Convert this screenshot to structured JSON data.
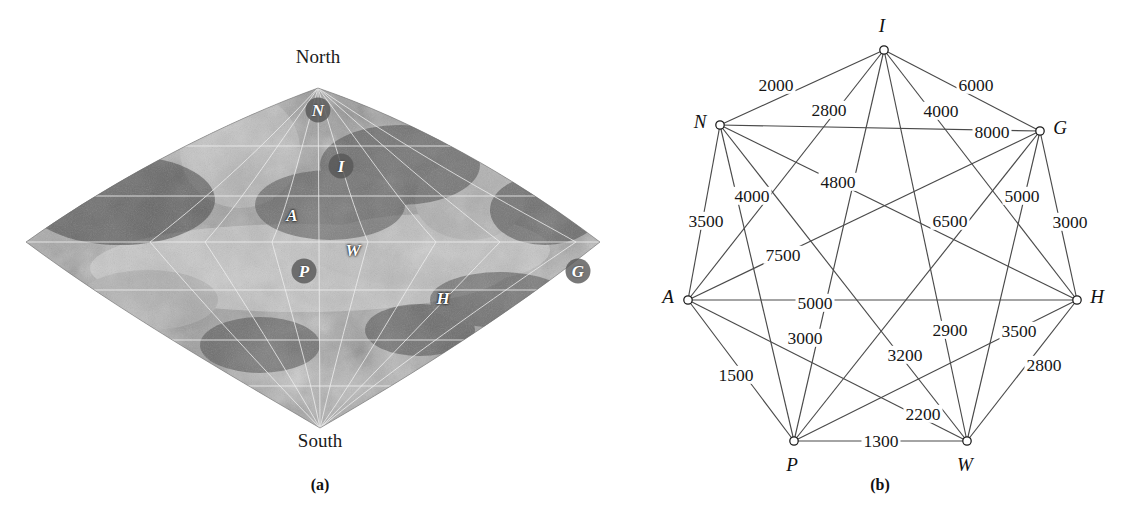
{
  "figure": {
    "panels": [
      {
        "caption": "(a)",
        "caption_x": 320,
        "caption_y": 476
      },
      {
        "caption": "(b)",
        "caption_x": 880,
        "caption_y": 476
      }
    ]
  },
  "map": {
    "north_label": "North",
    "south_label": "South",
    "north_x": 318,
    "north_y": 56,
    "south_x": 320,
    "south_y": 430,
    "sites": [
      {
        "id": "N",
        "label": "N",
        "x": 318,
        "y": 110,
        "badge": true
      },
      {
        "id": "I",
        "label": "I",
        "x": 341,
        "y": 166,
        "badge": true
      },
      {
        "id": "A",
        "label": "A",
        "x": 292,
        "y": 215,
        "badge": false
      },
      {
        "id": "W",
        "label": "W",
        "x": 353,
        "y": 250,
        "badge": false
      },
      {
        "id": "P",
        "label": "P",
        "x": 304,
        "y": 271,
        "badge": true
      },
      {
        "id": "H",
        "label": "H",
        "x": 443,
        "y": 298,
        "badge": false
      },
      {
        "id": "G",
        "label": "G",
        "x": 578,
        "y": 271,
        "badge": true
      }
    ]
  },
  "graph": {
    "type": "weighted-complete-graph",
    "node_count": 7,
    "edge_count": 21,
    "nodes": [
      {
        "id": "I",
        "label": "I",
        "x": 284,
        "y": 50,
        "label_dx": -2,
        "label_dy": -24
      },
      {
        "id": "N",
        "label": "N",
        "x": 120,
        "y": 125,
        "label_dx": -20,
        "label_dy": -3
      },
      {
        "id": "G",
        "label": "G",
        "x": 440,
        "y": 131,
        "label_dx": 20,
        "label_dy": -3
      },
      {
        "id": "A",
        "label": "A",
        "x": 88,
        "y": 300,
        "label_dx": -20,
        "label_dy": -3
      },
      {
        "id": "H",
        "label": "H",
        "x": 477,
        "y": 300,
        "label_dx": 20,
        "label_dy": -3
      },
      {
        "id": "P",
        "label": "P",
        "x": 194,
        "y": 441,
        "label_dx": -2,
        "label_dy": 24
      },
      {
        "id": "W",
        "label": "W",
        "x": 367,
        "y": 441,
        "label_dx": -2,
        "label_dy": 24
      }
    ],
    "edges": [
      {
        "from": "N",
        "to": "I",
        "weight": "2000",
        "lx": 176,
        "ly": 85
      },
      {
        "from": "I",
        "to": "P",
        "weight": "2800",
        "lx": 229,
        "ly": 110
      },
      {
        "from": "I",
        "to": "G",
        "weight": "6000",
        "lx": 376,
        "ly": 85
      },
      {
        "from": "I",
        "to": "W",
        "weight": "4000",
        "lx": 341,
        "ly": 111
      },
      {
        "from": "N",
        "to": "G",
        "weight": "8000",
        "lx": 392,
        "ly": 132
      },
      {
        "from": "N",
        "to": "A",
        "weight": "3500",
        "lx": 106,
        "ly": 221
      },
      {
        "from": "N",
        "to": "P",
        "weight": "4000",
        "lx": 152,
        "ly": 196
      },
      {
        "from": "N",
        "to": "H",
        "weight": "4800",
        "lx": 238,
        "ly": 182
      },
      {
        "from": "N",
        "to": "W",
        "weight": "7500",
        "lx": 183,
        "ly": 255
      },
      {
        "from": "A",
        "to": "I",
        "weight": "6500",
        "lx": 350,
        "ly": 221
      },
      {
        "from": "G",
        "to": "W",
        "weight": "5000",
        "lx": 422,
        "ly": 196
      },
      {
        "from": "G",
        "to": "H",
        "weight": "3000",
        "lx": 470,
        "ly": 222
      },
      {
        "from": "A",
        "to": "H",
        "weight": "5000",
        "lx": 215,
        "ly": 303
      },
      {
        "from": "A",
        "to": "W",
        "weight": "3000",
        "lx": 205,
        "ly": 338
      },
      {
        "from": "G",
        "to": "P",
        "weight": "2900",
        "lx": 350,
        "ly": 330
      },
      {
        "from": "A",
        "to": "G",
        "weight": "3500",
        "lx": 419,
        "ly": 331
      },
      {
        "from": "I",
        "to": "H",
        "weight": "3200",
        "lx": 305,
        "ly": 355
      },
      {
        "from": "P",
        "to": "H",
        "weight": "2800",
        "lx": 444,
        "ly": 365
      },
      {
        "from": "A",
        "to": "P",
        "weight": "1500",
        "lx": 136,
        "ly": 375
      },
      {
        "from": "W",
        "to": "H",
        "weight": "2200",
        "lx": 323,
        "ly": 414
      },
      {
        "from": "P",
        "to": "W",
        "weight": "1300",
        "lx": 281,
        "ly": 441
      }
    ]
  },
  "colors": {
    "edge": "#4a4a4a",
    "node_fill": "#ffffff",
    "node_stroke": "#1a1a1a",
    "text": "#111111",
    "map_dark": "#4b4b4b",
    "map_light": "#c9c9c9"
  }
}
